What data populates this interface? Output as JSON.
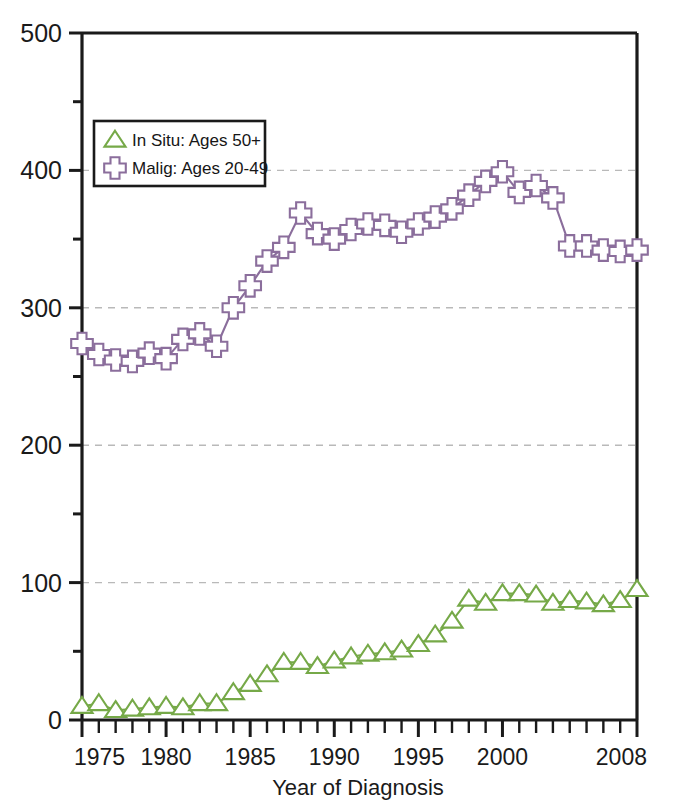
{
  "chart_data": {
    "type": "line",
    "title": "",
    "xlabel": "Year of Diagnosis",
    "ylabel": "",
    "xlim": [
      1975,
      2008
    ],
    "ylim": [
      0,
      500
    ],
    "grid": true,
    "grid_values": [
      100,
      200,
      300,
      400
    ],
    "legend_position": "upper-left",
    "x_tick_labels": [
      "1975",
      "1980",
      "1985",
      "1990",
      "1995",
      "2000",
      "2008"
    ],
    "x_tick_values": [
      1975,
      1980,
      1985,
      1990,
      1995,
      2000,
      2008
    ],
    "y_tick_labels": [
      "0",
      "100",
      "200",
      "300",
      "400",
      "500"
    ],
    "y_tick_values": [
      0,
      100,
      200,
      300,
      400,
      500
    ],
    "y_minor_tick_values": [
      50,
      150,
      250,
      350,
      450
    ],
    "x": [
      1975,
      1976,
      1977,
      1978,
      1979,
      1980,
      1981,
      1982,
      1983,
      1984,
      1985,
      1986,
      1987,
      1988,
      1989,
      1990,
      1991,
      1992,
      1993,
      1994,
      1995,
      1996,
      1997,
      1998,
      1999,
      2000,
      2001,
      2002,
      2003,
      2004,
      2005,
      2006,
      2007,
      2008
    ],
    "series": [
      {
        "name": "In Situ: Ages 50+",
        "marker": "triangle",
        "color": "#76a948",
        "values": [
          10,
          12,
          7,
          8,
          9,
          10,
          9,
          12,
          12,
          20,
          26,
          33,
          42,
          42,
          39,
          43,
          46,
          48,
          49,
          51,
          55,
          62,
          72,
          88,
          85,
          92,
          92,
          91,
          85,
          87,
          86,
          84,
          87,
          95
        ]
      },
      {
        "name": "Malig: Ages 20-49",
        "marker": "cross",
        "color": "#8b6e9c",
        "values": [
          274,
          266,
          262,
          261,
          267,
          263,
          277,
          281,
          272,
          300,
          316,
          334,
          344,
          369,
          354,
          350,
          357,
          361,
          360,
          355,
          361,
          366,
          372,
          382,
          392,
          399,
          384,
          389,
          380,
          345,
          345,
          342,
          341,
          342
        ]
      }
    ]
  },
  "legend": {
    "entries": [
      {
        "label": "In Situ: Ages 50+",
        "marker": "triangle-icon",
        "color": "#76a948"
      },
      {
        "label": "Malig: Ages 20-49",
        "marker": "cross-icon",
        "color": "#8b6e9c"
      }
    ]
  },
  "axis": {
    "x_title": "Year of Diagnosis"
  },
  "style": {
    "axis_color": "#1a1a1a",
    "grid_color": "#b9b9b9",
    "background": "#ffffff"
  }
}
